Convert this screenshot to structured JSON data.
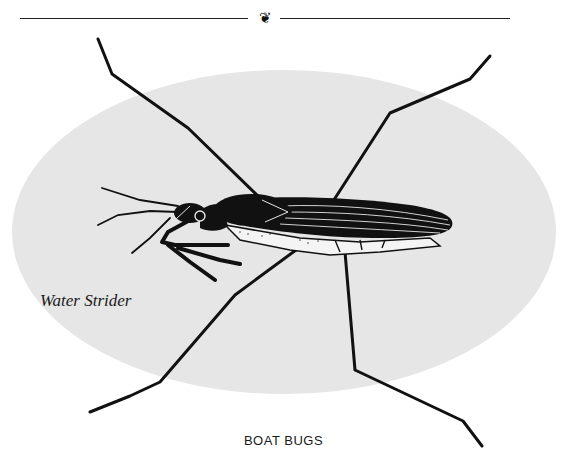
{
  "header": {
    "fleuron_icon": "fleuron-ornament",
    "fleuron_glyph": "❦"
  },
  "illustration": {
    "background_color": "#e6e6e6",
    "ink_color": "#111111",
    "subject": "water-strider-insect",
    "label": "Water Strider"
  },
  "caption": {
    "text": "BOAT BUGS"
  }
}
